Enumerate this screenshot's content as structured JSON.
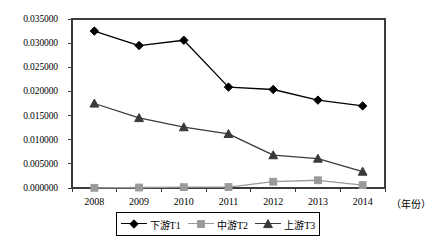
{
  "chart_data": {
    "type": "line",
    "title": "",
    "subtitle": "",
    "xlabel": "（年份）",
    "ylabel": "",
    "categories": [
      "2008",
      "2009",
      "2010",
      "2011",
      "2012",
      "2013",
      "2014"
    ],
    "x": [
      2008,
      2009,
      2010,
      2011,
      2012,
      2013,
      2014
    ],
    "ylim": [
      0.0,
      0.035
    ],
    "yticks": [
      0.0,
      0.005,
      0.01,
      0.015,
      0.02,
      0.025,
      0.03,
      0.035
    ],
    "ytick_labels": [
      "0.000000",
      "0.005000",
      "0.010000",
      "0.015000",
      "0.020000",
      "0.025000",
      "0.030000",
      "0.035000"
    ],
    "grid": false,
    "legend_position": "bottom",
    "series": [
      {
        "name": "下游T1",
        "marker": "diamond",
        "color": "#000000",
        "values": [
          0.0325,
          0.0295,
          0.0306,
          0.0209,
          0.0204,
          0.0182,
          0.017
        ]
      },
      {
        "name": "中游T2",
        "marker": "square",
        "color": "#9a9a9a",
        "values": [
          4e-05,
          0.0001,
          0.00018,
          0.0002,
          0.0013,
          0.0016,
          0.0006
        ]
      },
      {
        "name": "上游T3",
        "marker": "triangle",
        "color": "#3a3a3a",
        "values": [
          0.0175,
          0.0145,
          0.0126,
          0.0112,
          0.0068,
          0.0061,
          0.0034
        ]
      }
    ]
  },
  "axis": {
    "x_title": "（年份）"
  },
  "legend": {
    "entries": [
      {
        "label": "下游T1",
        "marker": "diamond",
        "color": "#000000"
      },
      {
        "label": "中游T2",
        "marker": "square",
        "color": "#9a9a9a"
      },
      {
        "label": "上游T3",
        "marker": "triangle",
        "color": "#3a3a3a"
      }
    ]
  }
}
